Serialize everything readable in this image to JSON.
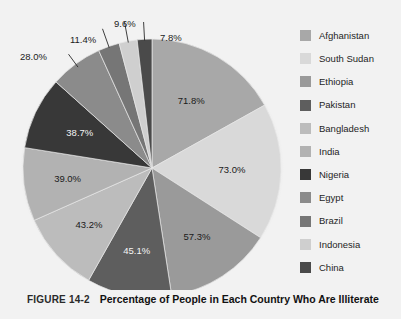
{
  "caption": {
    "figure_number": "FIGURE 14-2",
    "title": "Percentage of People in Each Country Who Are Illiterate"
  },
  "legend": {
    "position": "right",
    "items": [
      {
        "label": "Afghanistan",
        "color": "#a8a8a8"
      },
      {
        "label": "South Sudan",
        "color": "#d9d9d9"
      },
      {
        "label": "Ethiopia",
        "color": "#9a9a9a"
      },
      {
        "label": "Pakistan",
        "color": "#5e5e5e"
      },
      {
        "label": "Bangladesh",
        "color": "#bcbcbc"
      },
      {
        "label": "India",
        "color": "#b2b2b2"
      },
      {
        "label": "Nigeria",
        "color": "#383838"
      },
      {
        "label": "Egypt",
        "color": "#8b8b8b"
      },
      {
        "label": "Brazil",
        "color": "#767676"
      },
      {
        "label": "Indonesia",
        "color": "#cfcfcf"
      },
      {
        "label": "China",
        "color": "#4a4a4a"
      }
    ]
  },
  "chart_data": {
    "type": "pie",
    "title": "Percentage of People in Each Country Who Are Illiterate",
    "xlabel": "",
    "ylabel": "",
    "legend_position": "right",
    "grid": false,
    "start_angle_deg": 0,
    "direction": "clockwise",
    "categories": [
      "Afghanistan",
      "South Sudan",
      "Ethiopia",
      "Pakistan",
      "Bangladesh",
      "India",
      "Nigeria",
      "Egypt",
      "Brazil",
      "Indonesia",
      "China"
    ],
    "values": [
      71.8,
      73.0,
      57.3,
      45.1,
      43.2,
      39.0,
      38.7,
      28.0,
      11.4,
      9.6,
      7.8
    ],
    "value_labels": [
      "71.8%",
      "73.0%",
      "57.3%",
      "45.1%",
      "43.2%",
      "39.0%",
      "38.7%",
      "28.0%",
      "11.4%",
      "9.6%",
      "7.8%"
    ],
    "colors": [
      "#a8a8a8",
      "#d9d9d9",
      "#9a9a9a",
      "#5e5e5e",
      "#bcbcbc",
      "#b2b2b2",
      "#383838",
      "#8b8b8b",
      "#767676",
      "#cfcfcf",
      "#4a4a4a"
    ],
    "total": 424.9,
    "units": "percent of population illiterate",
    "callout_labels": [
      "28.0%",
      "11.4%",
      "9.6%",
      "7.8%"
    ],
    "inner_labels": [
      "71.8%",
      "73.0%",
      "57.3%",
      "45.1%",
      "43.2%",
      "39.0%",
      "38.7%"
    ]
  }
}
